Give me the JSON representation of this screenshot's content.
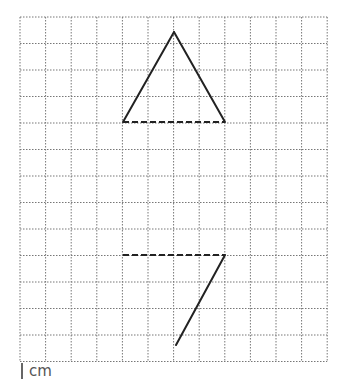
{
  "diagram": {
    "grid": {
      "x0": 20,
      "y0": 17,
      "cols": 12,
      "rows": 13,
      "cell_w": 25.6,
      "cell_h": 26.5,
      "line_color": "#777777"
    },
    "upper_figure": {
      "solid_lines": [
        [
          [
            123,
            122
          ],
          [
            174,
            32
          ]
        ],
        [
          [
            174,
            32
          ],
          [
            225,
            122
          ]
        ]
      ],
      "dashed_line": [
        [
          123,
          122
        ],
        [
          225,
          122
        ]
      ]
    },
    "lower_figure": {
      "dashed_line": [
        [
          123,
          255
        ],
        [
          225,
          255
        ]
      ],
      "solid_lines": [
        [
          [
            225,
            255
          ],
          [
            176,
            345
          ]
        ]
      ]
    },
    "stroke_color": "#222222"
  },
  "scale_label": "cm"
}
